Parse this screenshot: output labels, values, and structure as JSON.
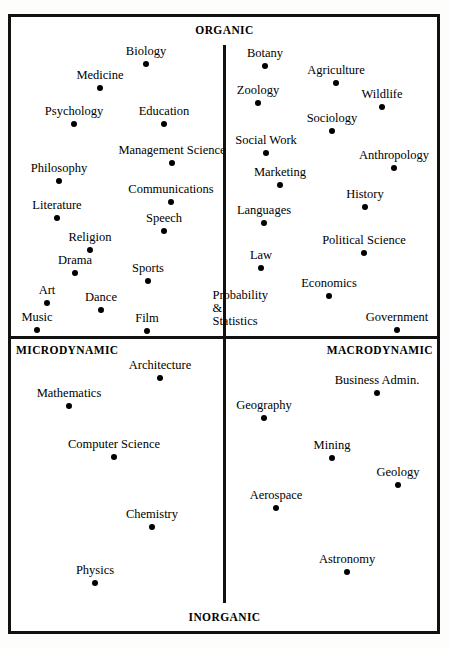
{
  "chart_data": {
    "type": "scatter",
    "title": "",
    "subtitle": "",
    "xlabel": "",
    "ylabel": "",
    "xlim": [
      0,
      449
    ],
    "ylim": [
      0,
      648
    ],
    "grid": false,
    "legend": null,
    "axes": {
      "vertical_axis_x": 224,
      "horizontal_axis_y": 337,
      "pole_top": "ORGANIC",
      "pole_bottom": "INORGANIC",
      "pole_left": "MICRODYNAMIC",
      "pole_right": "MACRODYNAMIC"
    },
    "quadrants": [
      {
        "name": "organic-microdynamic",
        "position": "top-left",
        "members": [
          "Biology",
          "Medicine",
          "Psychology",
          "Education",
          "Management Science",
          "Philosophy",
          "Communications",
          "Literature",
          "Speech",
          "Religion",
          "Drama",
          "Sports",
          "Art",
          "Dance",
          "Music",
          "Film"
        ]
      },
      {
        "name": "organic-macrodynamic",
        "position": "top-right",
        "members": [
          "Botany",
          "Agriculture",
          "Zoology",
          "Wildlife",
          "Sociology",
          "Social Work",
          "Anthropology",
          "Marketing",
          "History",
          "Languages",
          "Political Science",
          "Law",
          "Economics",
          "Probability & Statistics",
          "Government"
        ]
      },
      {
        "name": "inorganic-microdynamic",
        "position": "bottom-left",
        "members": [
          "Architecture",
          "Mathematics",
          "Computer Science",
          "Chemistry",
          "Physics"
        ]
      },
      {
        "name": "inorganic-macrodynamic",
        "position": "bottom-right",
        "members": [
          "Business Admin.",
          "Geography",
          "Mining",
          "Geology",
          "Aerospace",
          "Astronomy"
        ]
      }
    ],
    "points": [
      {
        "label": "Biology",
        "x": 146,
        "y": 64,
        "quadrant": "organic-microdynamic",
        "has_dot": true
      },
      {
        "label": "Medicine",
        "x": 100,
        "y": 88,
        "quadrant": "organic-microdynamic",
        "has_dot": true
      },
      {
        "label": "Psychology",
        "x": 74,
        "y": 124,
        "quadrant": "organic-microdynamic",
        "has_dot": true
      },
      {
        "label": "Education",
        "x": 164,
        "y": 124,
        "quadrant": "organic-microdynamic",
        "has_dot": true
      },
      {
        "label": "Management Science",
        "x": 172,
        "y": 163,
        "quadrant": "organic-microdynamic",
        "has_dot": true
      },
      {
        "label": "Philosophy",
        "x": 59,
        "y": 181,
        "quadrant": "organic-microdynamic",
        "has_dot": true
      },
      {
        "label": "Communications",
        "x": 171,
        "y": 202,
        "quadrant": "organic-microdynamic",
        "has_dot": true
      },
      {
        "label": "Literature",
        "x": 57,
        "y": 218,
        "quadrant": "organic-microdynamic",
        "has_dot": true
      },
      {
        "label": "Speech",
        "x": 164,
        "y": 231,
        "quadrant": "organic-microdynamic",
        "has_dot": true
      },
      {
        "label": "Religion",
        "x": 90,
        "y": 250,
        "quadrant": "organic-microdynamic",
        "has_dot": true
      },
      {
        "label": "Drama",
        "x": 75,
        "y": 273,
        "quadrant": "organic-microdynamic",
        "has_dot": true
      },
      {
        "label": "Sports",
        "x": 148,
        "y": 281,
        "quadrant": "organic-microdynamic",
        "has_dot": true
      },
      {
        "label": "Art",
        "x": 47,
        "y": 303,
        "quadrant": "organic-microdynamic",
        "has_dot": true
      },
      {
        "label": "Dance",
        "x": 101,
        "y": 310,
        "quadrant": "organic-microdynamic",
        "has_dot": true
      },
      {
        "label": "Music",
        "x": 37,
        "y": 330,
        "quadrant": "organic-microdynamic",
        "has_dot": true
      },
      {
        "label": "Film",
        "x": 147,
        "y": 331,
        "quadrant": "organic-microdynamic",
        "has_dot": true
      },
      {
        "label": "Botany",
        "x": 265,
        "y": 66,
        "quadrant": "organic-macrodynamic",
        "has_dot": true
      },
      {
        "label": "Agriculture",
        "x": 336,
        "y": 83,
        "quadrant": "organic-macrodynamic",
        "has_dot": true
      },
      {
        "label": "Zoology",
        "x": 258,
        "y": 103,
        "quadrant": "organic-macrodynamic",
        "has_dot": true
      },
      {
        "label": "Wildlife",
        "x": 382,
        "y": 107,
        "quadrant": "organic-macrodynamic",
        "has_dot": true
      },
      {
        "label": "Sociology",
        "x": 332,
        "y": 131,
        "quadrant": "organic-macrodynamic",
        "has_dot": true
      },
      {
        "label": "Social Work",
        "x": 266,
        "y": 153,
        "quadrant": "organic-macrodynamic",
        "has_dot": true
      },
      {
        "label": "Anthropology",
        "x": 394,
        "y": 168,
        "quadrant": "organic-macrodynamic",
        "has_dot": true
      },
      {
        "label": "Marketing",
        "x": 280,
        "y": 185,
        "quadrant": "organic-macrodynamic",
        "has_dot": true
      },
      {
        "label": "History",
        "x": 365,
        "y": 207,
        "quadrant": "organic-macrodynamic",
        "has_dot": true
      },
      {
        "label": "Languages",
        "x": 264,
        "y": 223,
        "quadrant": "organic-macrodynamic",
        "has_dot": true
      },
      {
        "label": "Political Science",
        "x": 364,
        "y": 253,
        "quadrant": "organic-macrodynamic",
        "has_dot": true
      },
      {
        "label": "Law",
        "x": 261,
        "y": 268,
        "quadrant": "organic-macrodynamic",
        "has_dot": true
      },
      {
        "label": "Economics",
        "x": 329,
        "y": 296,
        "quadrant": "organic-macrodynamic",
        "has_dot": true
      },
      {
        "label": "Probability\n& Statistics",
        "x": 268,
        "y": 334,
        "quadrant": "organic-macrodynamic",
        "has_dot": false
      },
      {
        "label": "Government",
        "x": 397,
        "y": 330,
        "quadrant": "organic-macrodynamic",
        "has_dot": true
      },
      {
        "label": "Architecture",
        "x": 160,
        "y": 378,
        "quadrant": "inorganic-microdynamic",
        "has_dot": true
      },
      {
        "label": "Mathematics",
        "x": 69,
        "y": 406,
        "quadrant": "inorganic-microdynamic",
        "has_dot": true
      },
      {
        "label": "Computer  Science",
        "x": 114,
        "y": 457,
        "quadrant": "inorganic-microdynamic",
        "has_dot": true
      },
      {
        "label": "Chemistry",
        "x": 152,
        "y": 527,
        "quadrant": "inorganic-microdynamic",
        "has_dot": true
      },
      {
        "label": "Physics",
        "x": 95,
        "y": 583,
        "quadrant": "inorganic-microdynamic",
        "has_dot": true
      },
      {
        "label": "Business  Admin.",
        "x": 377,
        "y": 393,
        "quadrant": "inorganic-macrodynamic",
        "has_dot": true
      },
      {
        "label": "Geography",
        "x": 264,
        "y": 418,
        "quadrant": "inorganic-macrodynamic",
        "has_dot": true
      },
      {
        "label": "Mining",
        "x": 332,
        "y": 458,
        "quadrant": "inorganic-macrodynamic",
        "has_dot": true
      },
      {
        "label": "Geology",
        "x": 398,
        "y": 485,
        "quadrant": "inorganic-macrodynamic",
        "has_dot": true
      },
      {
        "label": "Aerospace",
        "x": 276,
        "y": 508,
        "quadrant": "inorganic-macrodynamic",
        "has_dot": true
      },
      {
        "label": "Astronomy",
        "x": 347,
        "y": 572,
        "quadrant": "inorganic-macrodynamic",
        "has_dot": true
      }
    ],
    "colors": {
      "background": "#ffffff",
      "frame": "#111111",
      "axis": "#111111",
      "point": "#000000",
      "text": "#000000"
    }
  }
}
